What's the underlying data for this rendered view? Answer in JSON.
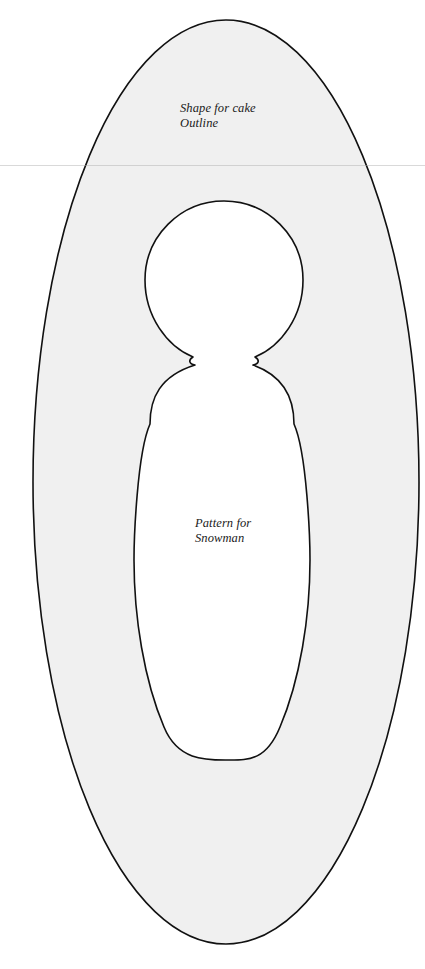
{
  "page": {
    "background_color": "#ffffff",
    "width": 425,
    "height": 969
  },
  "artwork": {
    "name": "cake-shape-snowman-pattern",
    "description": "Scanned craft template: a large vertical ellipse with a snowman-shaped cutout",
    "outer_shape": {
      "type": "ellipse",
      "fill_color": "#f0f0f0",
      "stroke_color": "#111111",
      "stroke_width": 1.6,
      "center_x": 226,
      "center_y": 482,
      "radius_x": 193,
      "radius_y": 462
    },
    "inner_shape": {
      "type": "snowman-cutout",
      "fill_color": "#ffffff",
      "stroke_color": "#111111",
      "stroke_width": 1.6,
      "head_center_x": 224,
      "head_center_y": 280,
      "head_radius": 79,
      "neck_y": 365,
      "neck_left_x": 193,
      "neck_right_x": 255,
      "body_widest_y": 560,
      "body_left_x": 148,
      "body_right_x": 307,
      "body_bottom_y": 760
    },
    "scan_artifact_line_y": 165
  },
  "labels": {
    "outline_caption": "Shape for cake\nOutline",
    "snowman_caption": "Pattern for\nSnowman"
  }
}
